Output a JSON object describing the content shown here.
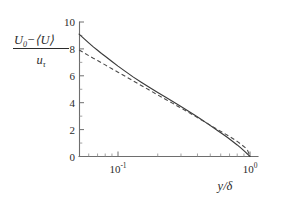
{
  "figure": {
    "background_color": "#ffffff",
    "line_color": "#3a3a3a",
    "axis_color": "#6e6e6e",
    "text_color": "#2b2b2b"
  },
  "axes": {
    "y_label_numerator_a": "U",
    "y_label_numerator_a_sub": "0",
    "y_label_numerator_minus": "−",
    "y_label_numerator_b": "⟨U⟩",
    "y_label_denominator": "u",
    "y_label_denominator_sub": "τ",
    "x_label_main": "y/δ",
    "x_tick_labels": [
      {
        "mantissa": "10",
        "exponent": "-1",
        "value": 0.1
      },
      {
        "mantissa": "10",
        "exponent": "0",
        "value": 1.0
      }
    ],
    "y_tick_labels": [
      "0",
      "2",
      "4",
      "6",
      "8",
      "10"
    ],
    "y_tick_values": [
      0,
      2,
      4,
      6,
      8,
      10
    ]
  },
  "chart_data": {
    "type": "line",
    "title": "",
    "subtitle": "",
    "xlabel": "y/δ",
    "ylabel": "(U_0 - <U>)/u_tau",
    "xscale": "log",
    "yscale": "linear",
    "xlim": [
      0.0507,
      1.12
    ],
    "ylim": [
      0,
      10
    ],
    "grid": false,
    "legend": "none",
    "x_ticks_major": [
      0.1,
      1.0
    ],
    "x_ticks_minor": [
      0.06,
      0.07,
      0.08,
      0.09,
      0.2,
      0.3,
      0.4,
      0.5,
      0.6,
      0.7,
      0.8,
      0.9
    ],
    "y_ticks_major": [
      0,
      2,
      4,
      6,
      8,
      10
    ],
    "y_ticks_minor": [
      1,
      3,
      5,
      7,
      9
    ],
    "series": [
      {
        "name": "velocity-defect data",
        "style": "solid",
        "x": [
          0.0507,
          0.055,
          0.06,
          0.065,
          0.07,
          0.075,
          0.08,
          0.09,
          0.1,
          0.115,
          0.13,
          0.15,
          0.17,
          0.2,
          0.23,
          0.26,
          0.3,
          0.34,
          0.38,
          0.42,
          0.47,
          0.52,
          0.57,
          0.62,
          0.68,
          0.74,
          0.8,
          0.86,
          0.92,
          0.96,
          1.0
        ],
        "y": [
          9.1,
          8.78,
          8.45,
          8.15,
          7.9,
          7.66,
          7.45,
          7.06,
          6.72,
          6.29,
          5.92,
          5.52,
          5.18,
          4.76,
          4.4,
          4.09,
          3.72,
          3.38,
          3.08,
          2.8,
          2.48,
          2.19,
          1.92,
          1.67,
          1.39,
          1.12,
          0.86,
          0.6,
          0.34,
          0.17,
          0.0
        ]
      },
      {
        "name": "log-law fit",
        "style": "dashed",
        "x": [
          0.0507,
          0.055,
          0.06,
          0.065,
          0.07,
          0.075,
          0.08,
          0.09,
          0.1,
          0.115,
          0.13,
          0.15,
          0.17,
          0.2,
          0.23,
          0.26,
          0.3,
          0.34,
          0.38,
          0.42,
          0.47,
          0.52,
          0.57,
          0.62,
          0.68,
          0.74,
          0.8,
          0.86,
          0.92,
          0.96,
          1.0
        ],
        "y": [
          7.92,
          7.72,
          7.5,
          7.3,
          7.14,
          6.97,
          6.81,
          6.52,
          6.27,
          5.93,
          5.63,
          5.28,
          4.98,
          4.58,
          4.24,
          3.95,
          3.6,
          3.3,
          3.02,
          2.77,
          2.49,
          2.23,
          2.0,
          1.79,
          1.56,
          1.34,
          1.12,
          0.89,
          0.66,
          0.45,
          0.0
        ]
      }
    ]
  }
}
